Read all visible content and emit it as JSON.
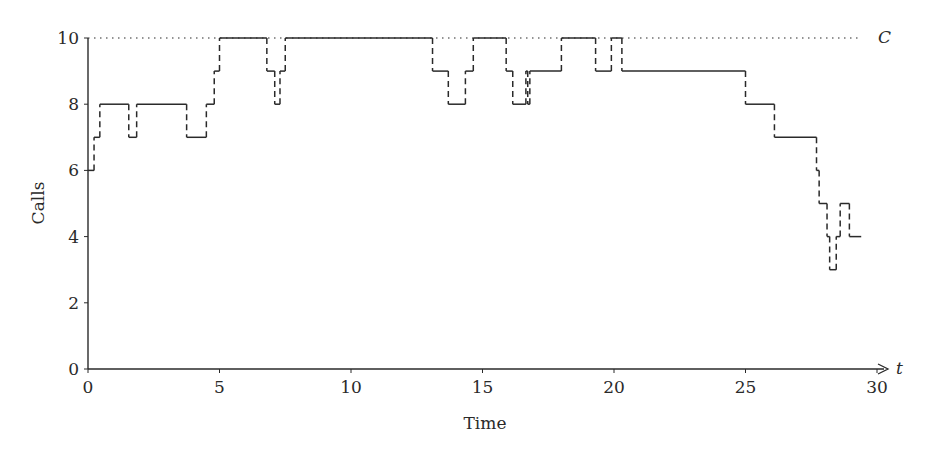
{
  "chart_data": {
    "type": "line",
    "subtype": "step",
    "title": "",
    "xlabel": "Time",
    "ylabel": "Calls",
    "xlim": [
      0,
      30
    ],
    "ylim": [
      0,
      10
    ],
    "x_ticks": [
      0,
      5,
      10,
      15,
      20,
      25,
      30
    ],
    "y_ticks": [
      0,
      2,
      4,
      6,
      8,
      10
    ],
    "x_axis_arrow_label": "t",
    "capacity_line": {
      "label": "C",
      "value": 10,
      "style": "dotted"
    },
    "grid": false,
    "legend": null,
    "series": [
      {
        "name": "Calls in progress",
        "style": "step: horizontal solid, vertical dashed",
        "points": [
          [
            0,
            6
          ],
          [
            0.23,
            7
          ],
          [
            0.45,
            8
          ],
          [
            1.55,
            7
          ],
          [
            1.85,
            8
          ],
          [
            3.75,
            7
          ],
          [
            4.5,
            8
          ],
          [
            4.8,
            9
          ],
          [
            5.0,
            10
          ],
          [
            6.8,
            9
          ],
          [
            7.1,
            8
          ],
          [
            7.3,
            9
          ],
          [
            7.5,
            10
          ],
          [
            13.1,
            9
          ],
          [
            13.7,
            8
          ],
          [
            14.35,
            9
          ],
          [
            14.65,
            10
          ],
          [
            15.9,
            9
          ],
          [
            16.15,
            8
          ],
          [
            16.65,
            9
          ],
          [
            16.72,
            8
          ],
          [
            16.8,
            9
          ],
          [
            18.0,
            10
          ],
          [
            19.3,
            9
          ],
          [
            19.9,
            10
          ],
          [
            20.3,
            9
          ],
          [
            25.0,
            8
          ],
          [
            26.1,
            7
          ],
          [
            27.7,
            6
          ],
          [
            27.8,
            5
          ],
          [
            28.1,
            4
          ],
          [
            28.2,
            3
          ],
          [
            28.45,
            4
          ],
          [
            28.6,
            5
          ],
          [
            28.95,
            4
          ],
          [
            29.4,
            4
          ]
        ]
      }
    ]
  },
  "labels": {
    "xlabel": "Time",
    "ylabel": "Calls",
    "t": "t",
    "C": "C"
  }
}
